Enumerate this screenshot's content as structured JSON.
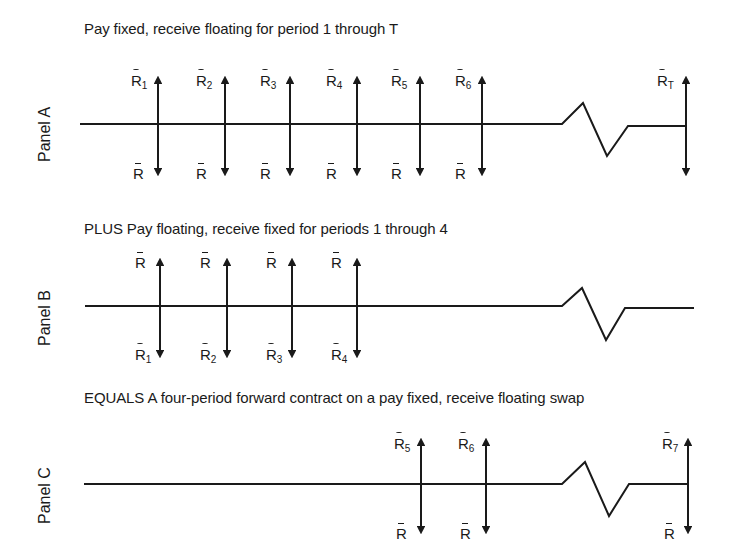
{
  "panels": {
    "a": {
      "label": "Panel A",
      "title": "Pay fixed, receive floating for period 1 through T",
      "top_labels": [
        {
          "base": "R",
          "sub": "1"
        },
        {
          "base": "R",
          "sub": "2"
        },
        {
          "base": "R",
          "sub": "3"
        },
        {
          "base": "R",
          "sub": "4"
        },
        {
          "base": "R",
          "sub": "5"
        },
        {
          "base": "R",
          "sub": "6"
        },
        {
          "base": "R",
          "sub": "T"
        }
      ],
      "bottom_labels": [
        "R",
        "R",
        "R",
        "R",
        "R",
        "R"
      ]
    },
    "b": {
      "label": "Panel B",
      "title": "PLUS Pay floating, receive fixed for periods 1 through 4",
      "top_labels": [
        "R",
        "R",
        "R",
        "R"
      ],
      "bottom_labels": [
        {
          "base": "R",
          "sub": "1"
        },
        {
          "base": "R",
          "sub": "2"
        },
        {
          "base": "R",
          "sub": "3"
        },
        {
          "base": "R",
          "sub": "4"
        }
      ]
    },
    "c": {
      "label": "Panel C",
      "title": "EQUALS A four-period forward contract on a pay fixed, receive floating swap",
      "top_labels": [
        {
          "base": "R",
          "sub": "5"
        },
        {
          "base": "R",
          "sub": "6"
        },
        {
          "base": "R",
          "sub": "7"
        }
      ],
      "bottom_labels": [
        "R",
        "R",
        "R"
      ]
    }
  },
  "colors": {
    "ink": "#1a1a1a",
    "background": "#ffffff"
  }
}
